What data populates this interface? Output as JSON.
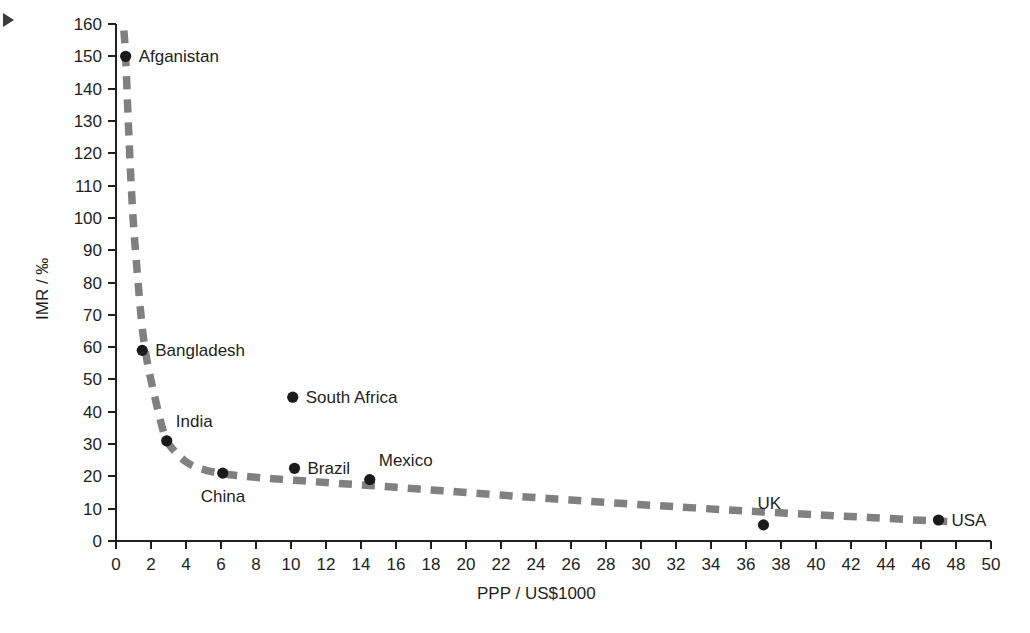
{
  "chart_data": {
    "type": "scatter",
    "title": "",
    "subtitle": "",
    "xlabel": "PPP / US$1000",
    "ylabel": "IMR / ‰",
    "xlim": [
      0,
      50
    ],
    "ylim": [
      0,
      160
    ],
    "xticks": [
      0,
      2,
      4,
      6,
      8,
      10,
      12,
      14,
      16,
      18,
      20,
      22,
      24,
      26,
      28,
      30,
      32,
      34,
      36,
      38,
      40,
      42,
      44,
      46,
      48,
      50
    ],
    "yticks": [
      0,
      10,
      20,
      30,
      40,
      50,
      60,
      70,
      80,
      90,
      100,
      110,
      120,
      130,
      140,
      150,
      160
    ],
    "grid": false,
    "legend": "none",
    "point_color": "#1a1a1a",
    "trend_color": "#808080",
    "axis_color": "#231f20",
    "points": [
      {
        "label": "Afganistan",
        "x": 0.55,
        "y": 150,
        "label_side": "right"
      },
      {
        "label": "Bangladesh",
        "x": 1.5,
        "y": 59,
        "label_side": "right"
      },
      {
        "label": "India",
        "x": 2.9,
        "y": 31,
        "label_side": "above-right"
      },
      {
        "label": "China",
        "x": 6.1,
        "y": 21,
        "label_side": "below"
      },
      {
        "label": "South Africa",
        "x": 10.1,
        "y": 44.5,
        "label_side": "right"
      },
      {
        "label": "Brazil",
        "x": 10.2,
        "y": 22.5,
        "label_side": "right"
      },
      {
        "label": "Mexico",
        "x": 14.5,
        "y": 19,
        "label_side": "above-right"
      },
      {
        "label": "UK",
        "x": 37.0,
        "y": 5,
        "label_side": "above"
      },
      {
        "label": "USA",
        "x": 47.0,
        "y": 6.5,
        "label_side": "right"
      }
    ],
    "trend_line": {
      "style": "dashed",
      "description": "Decreasing inverse-style curve fitted through the country points",
      "x": [
        0.45,
        0.55,
        0.7,
        0.85,
        1.0,
        1.2,
        1.5,
        1.8,
        2.2,
        2.6,
        2.9,
        3.4,
        4.0,
        4.6,
        5.2,
        6.1,
        7.0,
        8.0,
        9.0,
        10.2,
        11.5,
        13.0,
        14.5,
        16.0,
        18.0,
        20.0,
        23.0,
        26.0,
        29.0,
        32.0,
        35.0,
        37.0,
        40.0,
        43.0,
        46.0,
        47.5
      ],
      "y": [
        158,
        150,
        130,
        112,
        98,
        84,
        66,
        55,
        45,
        36,
        31,
        27.5,
        24.5,
        22.8,
        21.8,
        20.8,
        20.2,
        19.7,
        19.3,
        18.8,
        18.3,
        17.7,
        17.2,
        16.6,
        15.8,
        15.0,
        13.8,
        12.7,
        11.6,
        10.6,
        9.6,
        9.0,
        8.1,
        7.3,
        6.4,
        6.0
      ]
    }
  },
  "annotations": {
    "corner_marker": "arrow-marker"
  }
}
